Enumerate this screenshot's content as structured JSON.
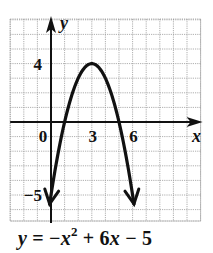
{
  "chart_data": {
    "type": "line",
    "title": "",
    "equation": {
      "lhs": "y",
      "eq": " = −",
      "x1": "x",
      "exp": "2",
      "mid": " + 6",
      "x2": "x",
      "tail": " − 5",
      "full": "y = −x² + 6x − 5"
    },
    "xlabel": "x",
    "ylabel": "y",
    "xlim": [
      -3,
      11
    ],
    "ylim": [
      -7,
      7
    ],
    "grid": true,
    "grid_step": 1,
    "x_tick_labels": [
      {
        "value": 0,
        "label": "0"
      },
      {
        "value": 3,
        "label": "3"
      },
      {
        "value": 6,
        "label": "6"
      }
    ],
    "y_tick_labels": [
      {
        "value": 4,
        "label": "4"
      },
      {
        "value": -5,
        "label": "−5"
      }
    ],
    "series": [
      {
        "name": "y = -x^2 + 6x - 5",
        "function": "-x^2 + 6x - 5",
        "domain": [
          -0.1,
          6.1
        ],
        "vertex": [
          3,
          4
        ],
        "x_intercepts": [
          1,
          5
        ],
        "y_intercept": -5,
        "arrows_at_ends": true,
        "x": [
          -0.1,
          0,
          0.5,
          1,
          1.5,
          2,
          2.5,
          3,
          3.5,
          4,
          4.5,
          5,
          5.5,
          6,
          6.1
        ],
        "y": [
          -5.61,
          -5,
          -2.25,
          0,
          1.75,
          3,
          3.75,
          4,
          3.75,
          3,
          1.75,
          0,
          -2.25,
          -5,
          -5.61
        ]
      }
    ],
    "colors": {
      "curve": "#111111",
      "axes": "#111111",
      "grid": "#9a9a9a",
      "background": "#ffffff"
    }
  }
}
